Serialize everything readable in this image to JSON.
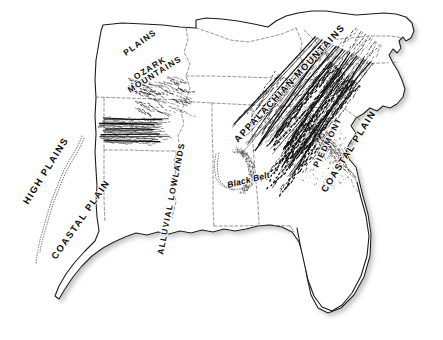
{
  "map": {
    "title": "Physiographic regions of the southeastern United States",
    "background_color": "#ffffff",
    "coastline_color": "#1a1a1a",
    "state_border_color": "#5b5b5b",
    "relief_color": "#111111",
    "shadow_color": "#cccccc",
    "labels": [
      {
        "id": "high-plains",
        "text": "HIGH PLAINS",
        "size": "lg",
        "x": 28,
        "y": 205,
        "rotate": -58
      },
      {
        "id": "coastal-plain-west",
        "text": "COASTAL PLAIN",
        "size": "lg",
        "x": 56,
        "y": 260,
        "rotate": -55
      },
      {
        "id": "plains",
        "text": "PLAINS",
        "size": "md",
        "x": 126,
        "y": 56,
        "rotate": -36
      },
      {
        "id": "ozark",
        "text": "OZARK",
        "size": "md",
        "x": 136,
        "y": 80,
        "rotate": -32
      },
      {
        "id": "mountains",
        "text": "MOUNTAINS",
        "size": "md",
        "x": 130,
        "y": 93,
        "rotate": -32
      },
      {
        "id": "alluvial-lowlands",
        "text": "ALLUVIAL LOWLANDS",
        "size": "md",
        "x": 163,
        "y": 255,
        "rotate": -79
      },
      {
        "id": "black-belt",
        "text": "Black Belt",
        "size": "bb",
        "x": 228,
        "y": 188,
        "rotate": -14
      },
      {
        "id": "appalachian",
        "text": "APPALACHIAN MOUNTAINS",
        "size": "lg",
        "x": 238,
        "y": 143,
        "rotate": -47
      },
      {
        "id": "piedmont",
        "text": "PIEDMONT",
        "size": "md",
        "x": 318,
        "y": 168,
        "rotate": -64
      },
      {
        "id": "coastal-plain-east",
        "text": "COASTAL PLAIN",
        "size": "lg",
        "x": 326,
        "y": 193,
        "rotate": -58
      }
    ]
  }
}
